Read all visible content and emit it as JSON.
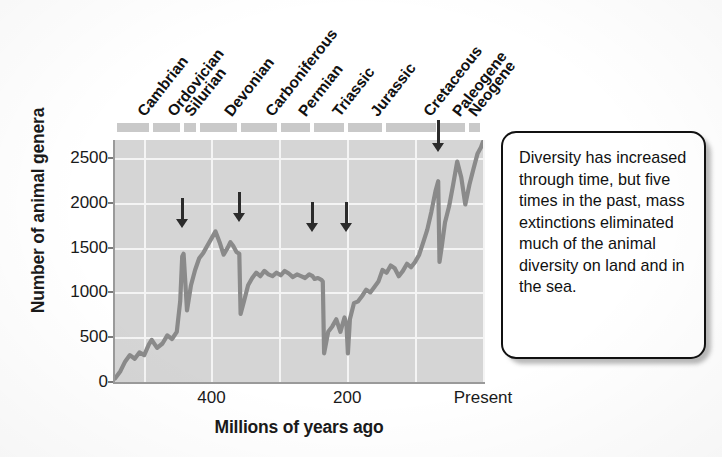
{
  "figure": {
    "ylabel": "Number of animal genera",
    "xlabel": "Millions of years ago"
  },
  "yaxis": {
    "ticks": [
      "0",
      "500",
      "1000",
      "1500",
      "2000",
      "2500"
    ]
  },
  "xaxis": {
    "ticks": [
      "400",
      "200",
      "Present"
    ]
  },
  "periods": [
    {
      "name": "Cambrian"
    },
    {
      "name": "Ordovician"
    },
    {
      "name": "Silurian"
    },
    {
      "name": "Devonian"
    },
    {
      "name": "Carboniferous"
    },
    {
      "name": "Permian"
    },
    {
      "name": "Triassic"
    },
    {
      "name": "Jurassic"
    },
    {
      "name": "Cretaceous"
    },
    {
      "name": "Paleogene"
    },
    {
      "name": "Neogene"
    }
  ],
  "callout": {
    "text": "Diversity has increased through time, but five times in the past, mass extinctions eliminated much of the animal diversity on land and in the sea."
  },
  "colors": {
    "plot_background": "#d5d5d5",
    "gridline": "#f4f4f4",
    "curve": "#8a8a8a",
    "period_bar": "#c9c9c9",
    "arrow": "#2b2b2b",
    "text": "#111111",
    "callout_border": "#111111"
  },
  "chart_data": {
    "type": "line",
    "title": "",
    "xlabel": "Millions of years ago",
    "ylabel": "Number of animal genera",
    "xlim": [
      542,
      0
    ],
    "ylim": [
      0,
      2700
    ],
    "x_reversed": true,
    "grid": true,
    "legend": "none",
    "xticks": [
      400,
      200,
      0
    ],
    "xticklabels": [
      "400",
      "200",
      "Present"
    ],
    "yticks": [
      0,
      500,
      1000,
      1500,
      2000,
      2500
    ],
    "series": [
      {
        "name": "Number of animal genera",
        "x": [
          542,
          534,
          527,
          520,
          513,
          506,
          499,
          492,
          488,
          480,
          472,
          465,
          458,
          451,
          446,
          443,
          441,
          436,
          430,
          424,
          418,
          412,
          406,
          400,
          394,
          388,
          382,
          376,
          372,
          368,
          363,
          359,
          357,
          352,
          346,
          340,
          334,
          328,
          322,
          316,
          310,
          304,
          298,
          292,
          286,
          280,
          274,
          268,
          262,
          256,
          251,
          248,
          243,
          238,
          236,
          234,
          228,
          222,
          216,
          210,
          204,
          201,
          199,
          196,
          190,
          184,
          178,
          172,
          166,
          160,
          154,
          148,
          142,
          136,
          130,
          124,
          118,
          112,
          106,
          100,
          94,
          88,
          82,
          76,
          70,
          66,
          64,
          61,
          56,
          50,
          44,
          38,
          32,
          26,
          20,
          14,
          8,
          3,
          0
        ],
        "y": [
          40,
          120,
          230,
          300,
          260,
          330,
          300,
          420,
          470,
          380,
          430,
          520,
          480,
          560,
          900,
          1400,
          1430,
          800,
          1080,
          1250,
          1380,
          1440,
          1520,
          1600,
          1680,
          1560,
          1420,
          1500,
          1560,
          1520,
          1450,
          1430,
          760,
          900,
          1080,
          1160,
          1220,
          1180,
          1240,
          1200,
          1180,
          1220,
          1190,
          1240,
          1210,
          1170,
          1200,
          1180,
          1160,
          1200,
          1180,
          1150,
          1160,
          1140,
          1120,
          320,
          560,
          620,
          700,
          560,
          720,
          640,
          320,
          700,
          880,
          900,
          960,
          1030,
          1000,
          1060,
          1120,
          1250,
          1220,
          1300,
          1270,
          1180,
          1240,
          1320,
          1280,
          1340,
          1420,
          1560,
          1700,
          1900,
          2130,
          2240,
          1340,
          1500,
          1780,
          1960,
          2200,
          2460,
          2280,
          1980,
          2200,
          2380,
          2550,
          2620,
          2680
        ]
      }
    ],
    "annotations": {
      "mass_extinction_arrows": [
        {
          "label": "End-Ordovician",
          "x": 443
        },
        {
          "label": "Late Devonian",
          "x": 359
        },
        {
          "label": "End-Permian",
          "x": 251
        },
        {
          "label": "End-Triassic",
          "x": 201
        },
        {
          "label": "End-Cretaceous",
          "x": 66
        }
      ],
      "period_bands": [
        {
          "name": "Cambrian",
          "start": 542,
          "end": 488
        },
        {
          "name": "Ordovician",
          "start": 488,
          "end": 443
        },
        {
          "name": "Silurian",
          "start": 443,
          "end": 419
        },
        {
          "name": "Devonian",
          "start": 419,
          "end": 359
        },
        {
          "name": "Carboniferous",
          "start": 359,
          "end": 299
        },
        {
          "name": "Permian",
          "start": 299,
          "end": 251
        },
        {
          "name": "Triassic",
          "start": 251,
          "end": 201
        },
        {
          "name": "Jurassic",
          "start": 201,
          "end": 145
        },
        {
          "name": "Cretaceous",
          "start": 145,
          "end": 66
        },
        {
          "name": "Paleogene",
          "start": 66,
          "end": 23
        },
        {
          "name": "Neogene",
          "start": 23,
          "end": 0
        }
      ]
    }
  }
}
